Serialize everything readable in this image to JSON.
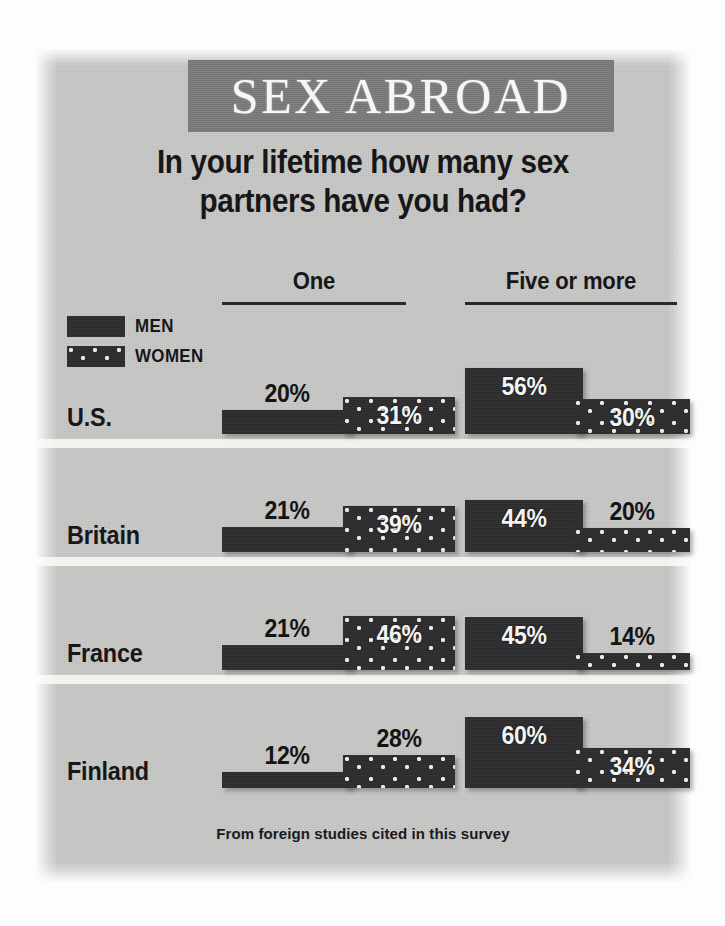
{
  "title": "SEX ABROAD",
  "subtitle_line1": "In your lifetime how many sex",
  "subtitle_line2": "partners have you had?",
  "footer": "From foreign studies cited in this survey",
  "legend": {
    "men_label": "MEN",
    "women_label": "WOMEN",
    "men_swatch": "solid-dark-swatch",
    "women_swatch": "dotted-dark-swatch"
  },
  "columns": [
    {
      "label": "One"
    },
    {
      "label": "Five or more"
    }
  ],
  "colors": {
    "panel_background": "#c9c9c7",
    "banner_background": "#7b7b79",
    "banner_text": "#f6f6f4",
    "bar_dark": "#2d2d2f",
    "bar_dot": "#e8e8e6",
    "text_dark": "#17171a",
    "value_text_inside": "#f4f4f2",
    "value_text_outside": "#141416"
  },
  "rows": [
    {
      "country": "U.S.",
      "one": {
        "men": "20%",
        "women": "31%"
      },
      "five_or_more": {
        "men": "56%",
        "women": "30%"
      }
    },
    {
      "country": "Britain",
      "one": {
        "men": "21%",
        "women": "39%"
      },
      "five_or_more": {
        "men": "44%",
        "women": "20%"
      }
    },
    {
      "country": "France",
      "one": {
        "men": "21%",
        "women": "46%"
      },
      "five_or_more": {
        "men": "45%",
        "women": "14%"
      }
    },
    {
      "country": "Finland",
      "one": {
        "men": "12%",
        "women": "28%"
      },
      "five_or_more": {
        "men": "60%",
        "women": "34%"
      }
    }
  ],
  "chart_data": {
    "type": "bar",
    "title": "SEX ABROAD",
    "subtitle": "In your lifetime how many sex partners have you had?",
    "annotation": "From foreign studies cited in this survey",
    "xlabel": "",
    "ylabel": "Percent of respondents",
    "ylim": [
      0,
      60
    ],
    "grid": false,
    "legend_position": "top-left",
    "value_unit": "%",
    "categories": [
      "U.S.",
      "Britain",
      "France",
      "Finland"
    ],
    "groups": [
      "One",
      "Five or more"
    ],
    "series": [
      {
        "name": "MEN",
        "group": "One",
        "values": [
          20,
          21,
          21,
          12
        ]
      },
      {
        "name": "WOMEN",
        "group": "One",
        "values": [
          31,
          39,
          46,
          28
        ]
      },
      {
        "name": "MEN",
        "group": "Five or more",
        "values": [
          56,
          44,
          45,
          60
        ]
      },
      {
        "name": "WOMEN",
        "group": "Five or more",
        "values": [
          30,
          20,
          14,
          34
        ]
      }
    ]
  }
}
